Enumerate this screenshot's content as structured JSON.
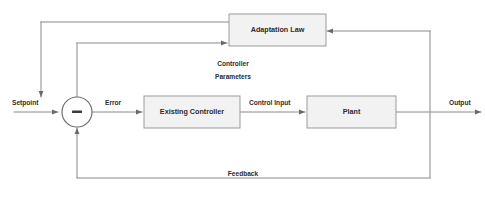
{
  "diagram": {
    "type": "block-diagram",
    "background_color": "#ffffff",
    "block_fill_color": "#f2f2f2",
    "block_border_color": "#9b9b9b",
    "wire_color": "#8a8a8a",
    "text_color": "#2b2b2b",
    "blocks": [
      {
        "id": "adaptation_law",
        "label": "Adaptation Law"
      },
      {
        "id": "existing_controller",
        "label": "Existing Controller"
      },
      {
        "id": "plant",
        "label": "Plant"
      }
    ],
    "junction": {
      "id": "summing_junction",
      "sign": "–",
      "description": "summing junction"
    },
    "signals": [
      {
        "id": "setpoint",
        "label": "Setpoint"
      },
      {
        "id": "error",
        "label": "Error"
      },
      {
        "id": "control_input",
        "label": "Control Input"
      },
      {
        "id": "output",
        "label": "Output"
      },
      {
        "id": "feedback",
        "label": "Feedback"
      },
      {
        "id": "controller_parameters_line1",
        "label": "Controller"
      },
      {
        "id": "controller_parameters_line2",
        "label": "Parameters"
      }
    ]
  }
}
